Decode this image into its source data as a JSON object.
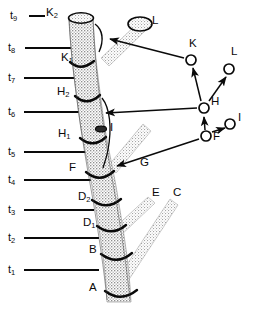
{
  "figure": {
    "kind": "segmented-stalk-lineage-diagram",
    "width": 255,
    "height": 313,
    "ink_color": "#0a0a0a",
    "stipple_color": "#8d8d8d",
    "background": "#ffffff"
  },
  "time_axis": {
    "ticks": [
      {
        "id": "t9",
        "label": "t",
        "sub": "9",
        "y": 16,
        "line_x1": 29,
        "line_x2": 45,
        "dash": true
      },
      {
        "id": "t8",
        "label": "t",
        "sub": "8",
        "y": 48,
        "line_x1": 25,
        "line_x2": 86,
        "dash": false
      },
      {
        "id": "t7",
        "label": "t",
        "sub": "7",
        "y": 78,
        "line_x1": 24,
        "line_x2": 86,
        "dash": false
      },
      {
        "id": "t6",
        "label": "t",
        "sub": "6",
        "y": 112,
        "line_x1": 24,
        "line_x2": 86,
        "dash": false
      },
      {
        "id": "t5",
        "label": "t",
        "sub": "5",
        "y": 152,
        "line_x1": 24,
        "line_x2": 86,
        "dash": false
      },
      {
        "id": "t4",
        "label": "t",
        "sub": "4",
        "y": 180,
        "line_x1": 24,
        "line_x2": 94,
        "dash": false
      },
      {
        "id": "t3",
        "label": "t",
        "sub": "3",
        "y": 210,
        "line_x1": 24,
        "line_x2": 94,
        "dash": false
      },
      {
        "id": "t2",
        "label": "t",
        "sub": "2",
        "y": 238,
        "line_x1": 24,
        "line_x2": 99,
        "dash": false
      },
      {
        "id": "t1",
        "label": "t",
        "sub": "1",
        "y": 270,
        "line_x1": 24,
        "line_x2": 99,
        "dash": false
      }
    ]
  },
  "internodes": [
    {
      "id": "K2",
      "label": "K",
      "sub": "2",
      "x": 46,
      "y": 12
    },
    {
      "id": "K1",
      "label": "K",
      "sub": "1",
      "x": 61,
      "y": 58
    },
    {
      "id": "H2",
      "label": "H",
      "sub": "2",
      "x": 58,
      "y": 92
    },
    {
      "id": "H1",
      "label": "H",
      "sub": "1",
      "x": 58,
      "y": 134
    },
    {
      "id": "F",
      "label": "F",
      "sub": "",
      "x": 67,
      "y": 168
    },
    {
      "id": "D2",
      "label": "D",
      "sub": "2",
      "x": 79,
      "y": 197
    },
    {
      "id": "D1",
      "label": "D",
      "sub": "1",
      "x": 83,
      "y": 223
    },
    {
      "id": "B",
      "label": "B",
      "sub": "",
      "x": 90,
      "y": 250
    },
    {
      "id": "A",
      "label": "A",
      "sub": "",
      "x": 89,
      "y": 288
    }
  ],
  "branch_labels": [
    {
      "id": "L",
      "label": "L",
      "x": 152,
      "y": 22
    },
    {
      "id": "I",
      "label": "I",
      "x": 110,
      "y": 128
    },
    {
      "id": "G",
      "label": "G",
      "x": 140,
      "y": 163
    },
    {
      "id": "E",
      "label": "E",
      "x": 152,
      "y": 193
    },
    {
      "id": "C",
      "label": "C",
      "x": 173,
      "y": 193
    }
  ],
  "network": {
    "title": "",
    "nodes": [
      {
        "id": "K",
        "label": "K",
        "cx": 191,
        "cy": 60,
        "r": 5,
        "label_x": 197,
        "label_y": 44
      },
      {
        "id": "L",
        "label": "L",
        "cx": 229,
        "cy": 69,
        "r": 5,
        "label_x": 236,
        "label_y": 52
      },
      {
        "id": "H",
        "label": "H",
        "cx": 204,
        "cy": 108,
        "r": 5,
        "label_x": 211,
        "label_y": 100
      },
      {
        "id": "I",
        "label": "I",
        "cx": 230,
        "cy": 124,
        "r": 5,
        "label_x": 238,
        "label_y": 117
      },
      {
        "id": "F",
        "label": "F",
        "cx": 206,
        "cy": 136,
        "r": 5,
        "label_x": 213,
        "label_y": 134
      }
    ],
    "edges": [
      {
        "from": "H",
        "to": "K",
        "kind": "arrow"
      },
      {
        "from": "H",
        "to": "L",
        "kind": "arrow"
      },
      {
        "from": "F",
        "to": "H",
        "kind": "arrow"
      },
      {
        "from": "F",
        "to": "I",
        "kind": "arrow"
      }
    ],
    "stalk_links": [
      {
        "id": "link-K",
        "from_node": "K",
        "to_stalk": "K1-node",
        "kind": "arrow-left"
      },
      {
        "id": "link-H",
        "from_node": "H",
        "to_stalk": "H2-node",
        "kind": "arrow-left"
      },
      {
        "id": "link-F",
        "from_node": "F",
        "to_stalk": "F-node",
        "kind": "arrow-left"
      }
    ]
  }
}
